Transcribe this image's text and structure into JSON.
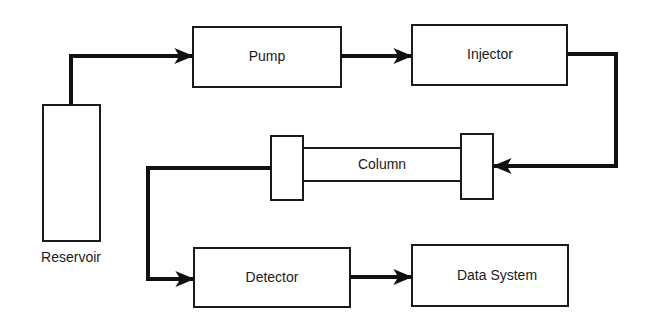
{
  "diagram": {
    "type": "flowchart",
    "colors": {
      "stroke": "#1a1a1a",
      "background": "#ffffff"
    },
    "nodes": [
      {
        "id": "reservoir",
        "label": "Reservoir"
      },
      {
        "id": "pump",
        "label": "Pump"
      },
      {
        "id": "injector",
        "label": "Injector"
      },
      {
        "id": "column",
        "label": "Column"
      },
      {
        "id": "detector",
        "label": "Detector"
      },
      {
        "id": "data_system",
        "label": "Data System"
      }
    ],
    "edges": [
      {
        "from": "reservoir",
        "to": "pump"
      },
      {
        "from": "pump",
        "to": "injector"
      },
      {
        "from": "injector",
        "to": "column"
      },
      {
        "from": "column",
        "to": "detector"
      },
      {
        "from": "detector",
        "to": "data_system"
      }
    ]
  }
}
